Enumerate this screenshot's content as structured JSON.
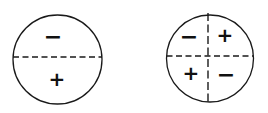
{
  "diagram": {
    "colors": {
      "stroke": "#1a1a1a",
      "background": "#ffffff"
    },
    "circles": [
      {
        "name": "two-region-circle",
        "cx": 57.5,
        "cy": 59.5,
        "r": 45,
        "dividers": [
          {
            "orientation": "horizontal",
            "position": 57
          }
        ],
        "regions": [
          {
            "label": "−",
            "x": 53,
            "y": 44,
            "region": "top"
          },
          {
            "label": "+",
            "x": 57,
            "y": 86,
            "region": "bottom"
          }
        ]
      },
      {
        "name": "four-region-circle",
        "cx": 210,
        "cy": 58.5,
        "r": 44,
        "dividers": [
          {
            "orientation": "horizontal",
            "position": 56
          },
          {
            "orientation": "vertical",
            "position": 208
          }
        ],
        "regions": [
          {
            "label": "−",
            "x": 190,
            "y": 44,
            "region": "top-left"
          },
          {
            "label": "+",
            "x": 225,
            "y": 41,
            "region": "top-right"
          },
          {
            "label": "+",
            "x": 191,
            "y": 79,
            "region": "bottom-left"
          },
          {
            "label": "−",
            "x": 227,
            "y": 83,
            "region": "bottom-right"
          }
        ]
      }
    ]
  }
}
